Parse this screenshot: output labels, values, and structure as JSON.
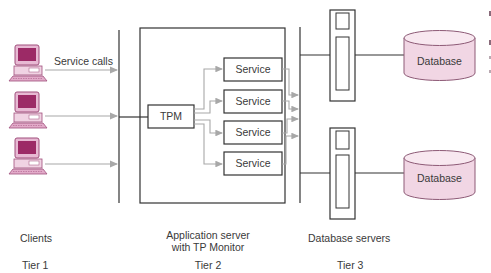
{
  "diagram": {
    "type": "three-tier TP monitor architecture",
    "labels": {
      "service_calls": "Service calls",
      "tpm": "TPM",
      "service": "Service",
      "database": "Database"
    },
    "services": [
      "Service",
      "Service",
      "Service",
      "Service"
    ],
    "databases": [
      "Database",
      "Database"
    ],
    "tiers": [
      {
        "name": "Clients",
        "tier": "Tier 1"
      },
      {
        "name_line1": "Application server",
        "name_line2": "with TP Monitor",
        "tier": "Tier 2"
      },
      {
        "name": "Database servers",
        "tier": "Tier 3"
      }
    ],
    "colors": {
      "client_pc": "#b03a78",
      "client_pc_light": "#e7b9d3",
      "database_fill": "#f1d6e4",
      "database_stroke": "#8d5a76",
      "line": "#333333",
      "arrow": "#a8a8a8"
    }
  }
}
